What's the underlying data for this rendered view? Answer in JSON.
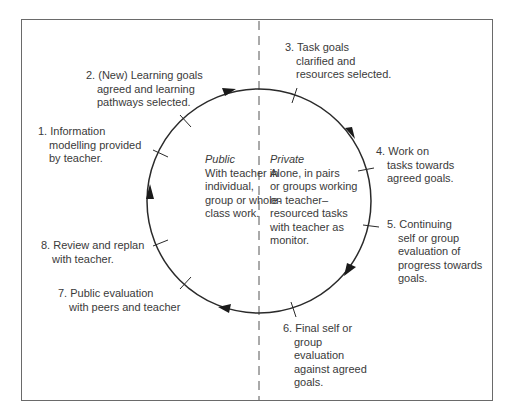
{
  "diagram": {
    "type": "cycle",
    "divider": "dashed-vertical",
    "zones": {
      "public": {
        "title": "Public",
        "lines": [
          "With teacher in",
          "individual,",
          "group or whole-",
          "class work."
        ]
      },
      "private": {
        "title": "Private",
        "lines": [
          "Alone, in pairs",
          "or groups working",
          "on teacher–",
          "resourced tasks",
          "with teacher as",
          "monitor."
        ]
      }
    },
    "steps": [
      {
        "number": "1.",
        "lines": [
          "Information",
          "modelling provided",
          "by teacher."
        ]
      },
      {
        "number": "2.",
        "lines": [
          "(New) Learning goals",
          "agreed and learning",
          "pathways selected."
        ]
      },
      {
        "number": "3.",
        "lines": [
          "Task goals",
          "clarified and",
          "resources selected."
        ]
      },
      {
        "number": "4.",
        "lines": [
          "Work on",
          "tasks towards",
          "agreed goals."
        ]
      },
      {
        "number": "5.",
        "lines": [
          "Continuing",
          "self or group",
          "evaluation of",
          "progress towards",
          "goals."
        ]
      },
      {
        "number": "6.",
        "lines": [
          "Final self or",
          "group",
          "evaluation",
          "against agreed",
          "goals."
        ]
      },
      {
        "number": "7.",
        "lines": [
          "Public evaluation",
          "with peers and teacher"
        ]
      },
      {
        "number": "8.",
        "lines": [
          "Review and replan",
          "with teacher."
        ]
      }
    ],
    "colors": {
      "line": "#2a2a2a",
      "frame": "#6a6a6a",
      "text": "#3a3a3a"
    }
  }
}
